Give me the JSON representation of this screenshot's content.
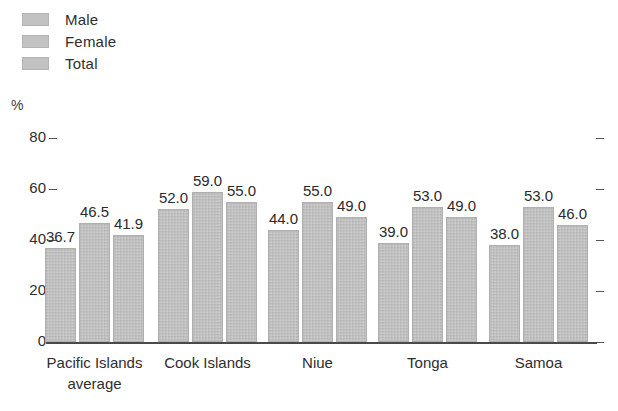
{
  "chart_data": {
    "type": "bar",
    "title": "",
    "xlabel": "",
    "ylabel": "%",
    "ylim": [
      0,
      80
    ],
    "yticks": [
      0,
      20,
      40,
      60,
      80
    ],
    "grid": false,
    "legend_position": "top-left",
    "categories": [
      "Pacific Islands\naverage",
      "Cook Islands",
      "Niue",
      "Tonga",
      "Samoa"
    ],
    "series": [
      {
        "name": "Male",
        "values": [
          36.7,
          52.0,
          44.0,
          39.0,
          38.0
        ],
        "labels": [
          "36.7",
          "52.0",
          "44.0",
          "39.0",
          "38.0"
        ],
        "color": "#c2c2c2"
      },
      {
        "name": "Female",
        "values": [
          46.5,
          59.0,
          55.0,
          53.0,
          53.0
        ],
        "labels": [
          "46.5",
          "59.0",
          "55.0",
          "53.0",
          "53.0"
        ],
        "color": "#c2c2c2"
      },
      {
        "name": "Total",
        "values": [
          41.9,
          55.0,
          49.0,
          49.0,
          46.0
        ],
        "labels": [
          "41.9",
          "55.0",
          "49.0",
          "49.0",
          "46.0"
        ],
        "color": "#c2c2c2"
      }
    ]
  },
  "axis": {
    "unit_label": "%",
    "tick_labels": [
      "80",
      "60",
      "40",
      "20",
      "0"
    ]
  },
  "legend": {
    "items": [
      {
        "label": "Male"
      },
      {
        "label": "Female"
      },
      {
        "label": "Total"
      }
    ]
  }
}
